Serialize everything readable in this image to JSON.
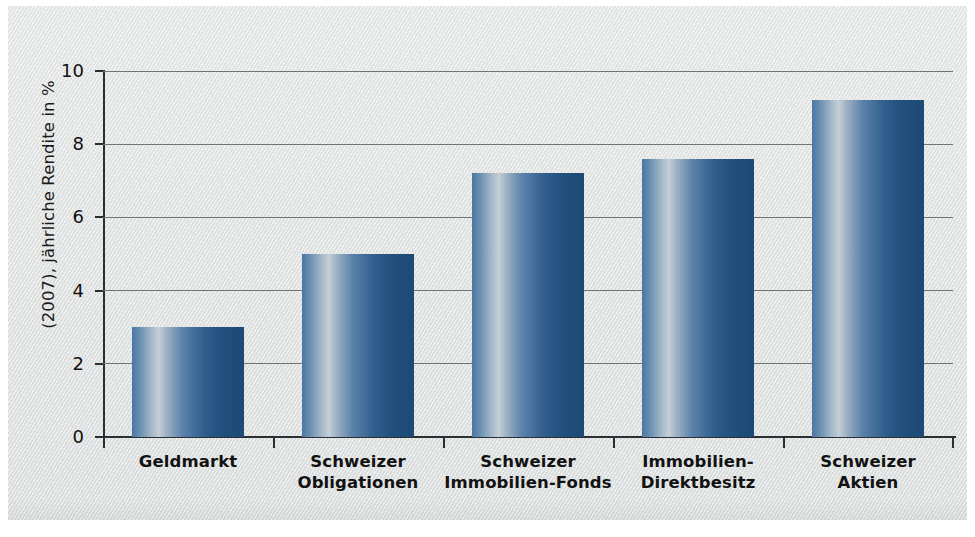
{
  "chart_data": {
    "type": "bar",
    "title": "",
    "xlabel": "",
    "ylabel": "(2007), jährliche Rendite in %",
    "categories": [
      "Geldmarkt",
      "Schweizer Obligationen",
      "Schweizer Immobilien-Fonds",
      "Immobilien-Direktbesitz",
      "Schweizer Aktien"
    ],
    "category_lines": [
      [
        "Geldmarkt",
        ""
      ],
      [
        "Schweizer",
        "Obligationen"
      ],
      [
        "Schweizer",
        "Immobilien-Fonds"
      ],
      [
        "Immobilien-",
        "Direktbesitz"
      ],
      [
        "Schweizer",
        "Aktien"
      ]
    ],
    "values": [
      3.0,
      5.0,
      7.2,
      7.6,
      9.2
    ],
    "ylim": [
      0,
      10
    ],
    "yticks": [
      0,
      2,
      4,
      6,
      8,
      10
    ],
    "ytick_labels": [
      "0",
      "2",
      "4",
      "6",
      "8",
      "10"
    ],
    "grid": "horizontal",
    "legend": "none",
    "units": "%"
  },
  "colors": {
    "panel_background": "#e4e6e6",
    "page_background": "#ffffff",
    "axis": "#2b2f31",
    "gridline": "#6f7476",
    "bar_left": "#4b76a1",
    "bar_highlight": "#c3ced8",
    "bar_right": "#1d4a74",
    "text": "#121212"
  }
}
